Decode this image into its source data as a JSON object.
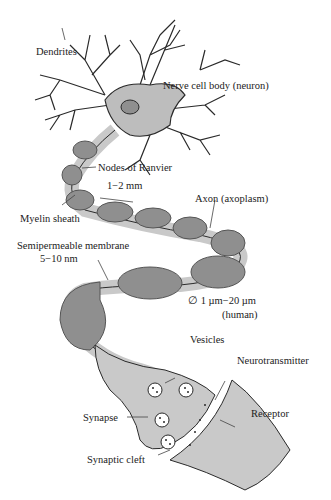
{
  "diagram": {
    "colors": {
      "myelin": "#8f8f8f",
      "axon": "#c9c9c9",
      "body": "#bdbdbd",
      "line": "#2a2a2a",
      "background": "#ffffff"
    },
    "labels": {
      "dendrites": "Dendrites",
      "cell_body": "Nerve cell body (neuron)",
      "nodes_of_ranvier": "Nodes of Ranvier",
      "node_spacing": "1−2 mm",
      "myelin_sheath": "Myelin sheath",
      "axon": "Axon (axoplasm)",
      "membrane": "Semipermeable membrane",
      "membrane_thickness": "5−10 nm",
      "diameter": "∅  1 µm−20 µm",
      "diameter_note": "(human)",
      "vesicles": "Vesicles",
      "neurotransmitter": "Neurotransmitter",
      "receptor": "Receptor",
      "synapse": "Synapse",
      "synaptic_cleft": "Synaptic cleft"
    }
  }
}
